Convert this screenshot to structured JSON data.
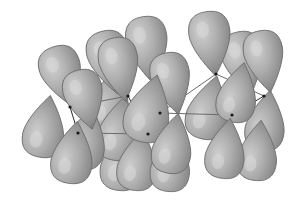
{
  "figure": {
    "background_color": "#ffffff",
    "lobe": {
      "fill_light": "#c3c3c3",
      "fill_mid": "#9a9a9a",
      "fill_dark": "#707070",
      "outline_color": "#6e6e6e",
      "highlight_color": "#d8d8d8"
    },
    "bond": {
      "color": "#2b2b2b",
      "light_color": "#6b6b6b",
      "width": 1
    },
    "vertex": {
      "color": "#1a1a1a",
      "radius": 1.6
    },
    "atoms": [
      {
        "name": "atom-left-upper",
        "x": 70,
        "y": 107
      },
      {
        "name": "atom-left-lower",
        "x": 78,
        "y": 133
      },
      {
        "name": "atom-center-up",
        "x": 128,
        "y": 96
      },
      {
        "name": "atom-center-mid",
        "x": 160,
        "y": 113
      },
      {
        "name": "atom-center-low",
        "x": 148,
        "y": 134
      },
      {
        "name": "atom-right-up",
        "x": 216,
        "y": 74
      },
      {
        "name": "atom-right-mid",
        "x": 232,
        "y": 115
      },
      {
        "name": "atom-right-edge",
        "x": 264,
        "y": 96
      }
    ],
    "bonds": [
      {
        "name": "bond-left-upper-to-left-lower",
        "from": 0,
        "to": 1,
        "shade": "dark"
      },
      {
        "name": "bond-left-upper-to-center-up",
        "from": 0,
        "to": 2,
        "shade": "light"
      },
      {
        "name": "bond-left-lower-to-center-low",
        "from": 1,
        "to": 4,
        "shade": "light"
      },
      {
        "name": "bond-center-up-to-center-low",
        "from": 2,
        "to": 4,
        "shade": "dark"
      },
      {
        "name": "bond-center-low-to-center-mid",
        "from": 4,
        "to": 3,
        "shade": "dark"
      },
      {
        "name": "bond-center-mid-to-right-mid",
        "from": 3,
        "to": 6,
        "shade": "light"
      },
      {
        "name": "bond-center-mid-to-right-up",
        "from": 3,
        "to": 5,
        "shade": "light"
      },
      {
        "name": "bond-right-mid-to-right-edge",
        "from": 6,
        "to": 7,
        "shade": "dark"
      },
      {
        "name": "bond-right-up-to-right-edge",
        "from": 5,
        "to": 7,
        "shade": "light"
      }
    ],
    "lobes": [
      {
        "name": "lobe-1",
        "cx": 63,
        "cy": 77,
        "rx": 21,
        "ry": 31,
        "rot": -18,
        "tip": "down"
      },
      {
        "name": "lobe-2",
        "cx": 110,
        "cy": 63,
        "rx": 21,
        "ry": 32,
        "rot": -14,
        "tip": "down"
      },
      {
        "name": "lobe-3",
        "cx": 45,
        "cy": 126,
        "rx": 21,
        "ry": 31,
        "rot": 10,
        "tip": "up"
      },
      {
        "name": "lobe-4",
        "cx": 86,
        "cy": 138,
        "rx": 21,
        "ry": 31,
        "rot": 12,
        "tip": "up"
      },
      {
        "name": "lobe-5",
        "cx": 110,
        "cy": 100,
        "rx": 22,
        "ry": 32,
        "rot": 16,
        "tip": "up"
      },
      {
        "name": "lobe-6",
        "cx": 73,
        "cy": 152,
        "rx": 21,
        "ry": 31,
        "rot": 8,
        "tip": "up"
      },
      {
        "name": "lobe-7",
        "cx": 122,
        "cy": 159,
        "rx": 21,
        "ry": 31,
        "rot": 6,
        "tip": "up"
      },
      {
        "name": "lobe-8",
        "cx": 120,
        "cy": 70,
        "rx": 20,
        "ry": 32,
        "rot": -10,
        "tip": "down"
      },
      {
        "name": "lobe-9",
        "cx": 148,
        "cy": 50,
        "rx": 21,
        "ry": 33,
        "rot": -8,
        "tip": "down"
      },
      {
        "name": "lobe-10",
        "cx": 172,
        "cy": 84,
        "rx": 20,
        "ry": 31,
        "rot": -12,
        "tip": "down"
      },
      {
        "name": "lobe-11",
        "cx": 119,
        "cy": 128,
        "rx": 21,
        "ry": 32,
        "rot": 10,
        "tip": "up"
      },
      {
        "name": "lobe-12",
        "cx": 149,
        "cy": 108,
        "rx": 23,
        "ry": 34,
        "rot": 14,
        "tip": "up"
      },
      {
        "name": "lobe-13",
        "cx": 138,
        "cy": 160,
        "rx": 20,
        "ry": 30,
        "rot": 8,
        "tip": "up"
      },
      {
        "name": "lobe-14",
        "cx": 173,
        "cy": 143,
        "rx": 20,
        "ry": 30,
        "rot": 10,
        "tip": "up"
      },
      {
        "name": "lobe-15",
        "cx": 171,
        "cy": 161,
        "rx": 20,
        "ry": 30,
        "rot": 6,
        "tip": "up"
      },
      {
        "name": "lobe-16",
        "cx": 211,
        "cy": 44,
        "rx": 21,
        "ry": 32,
        "rot": -8,
        "tip": "down"
      },
      {
        "name": "lobe-17",
        "cx": 244,
        "cy": 64,
        "rx": 21,
        "ry": 32,
        "rot": -12,
        "tip": "down"
      },
      {
        "name": "lobe-18",
        "cx": 265,
        "cy": 62,
        "rx": 20,
        "ry": 31,
        "rot": -10,
        "tip": "down"
      },
      {
        "name": "lobe-19",
        "cx": 209,
        "cy": 107,
        "rx": 21,
        "ry": 32,
        "rot": 14,
        "tip": "up"
      },
      {
        "name": "lobe-20",
        "cx": 238,
        "cy": 92,
        "rx": 20,
        "ry": 30,
        "rot": 12,
        "tip": "up"
      },
      {
        "name": "lobe-21",
        "cx": 266,
        "cy": 120,
        "rx": 20,
        "ry": 30,
        "rot": 8,
        "tip": "up"
      },
      {
        "name": "lobe-22",
        "cx": 226,
        "cy": 148,
        "rx": 20,
        "ry": 30,
        "rot": 8,
        "tip": "up"
      },
      {
        "name": "lobe-23",
        "cx": 258,
        "cy": 150,
        "rx": 20,
        "ry": 30,
        "rot": 6,
        "tip": "up"
      },
      {
        "name": "lobe-24",
        "cx": 85,
        "cy": 100,
        "rx": 20,
        "ry": 30,
        "rot": -14,
        "tip": "down"
      }
    ]
  }
}
